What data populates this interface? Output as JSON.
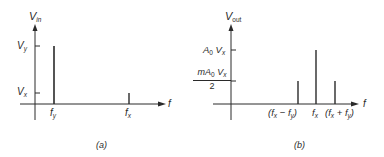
{
  "diagram": {
    "panel_a": {
      "caption": "(a)",
      "y_axis_label": "V",
      "y_axis_sub": "in",
      "x_axis_label": "f",
      "y_ticks": [
        {
          "label": "V",
          "sub": "y"
        },
        {
          "label": "V",
          "sub": "x"
        }
      ],
      "x_ticks": [
        {
          "label": "f",
          "sub": "y"
        },
        {
          "label": "f",
          "sub": "x"
        }
      ],
      "lines": [
        {
          "at": "f_y",
          "height": "V_y"
        },
        {
          "at": "f_x",
          "height": "V_x"
        }
      ]
    },
    "panel_b": {
      "caption": "(b)",
      "y_axis_label": "V",
      "y_axis_sub": "out",
      "x_axis_label": "f",
      "y_ticks": [
        {
          "label": "A",
          "sub": "0",
          "label2": "V",
          "sub2": "x"
        },
        {
          "num_pre": "mA",
          "num_sub": "0",
          "num_label2": "V",
          "num_sub2": "x",
          "den": "2"
        }
      ],
      "x_ticks": [
        {
          "pre": "(f",
          "sub": "x",
          "mid": " − f",
          "sub2": "y",
          "post": ")"
        },
        {
          "label": "f",
          "sub": "x"
        },
        {
          "pre": "(f",
          "sub": "x",
          "mid": " + f",
          "sub2": "y",
          "post": ")"
        }
      ],
      "lines": [
        {
          "at": "f_x - f_y",
          "height": "m A_0 V_x / 2"
        },
        {
          "at": "f_x",
          "height": "A_0 V_x"
        },
        {
          "at": "f_x + f_y",
          "height": "m A_0 V_x / 2"
        }
      ]
    }
  }
}
